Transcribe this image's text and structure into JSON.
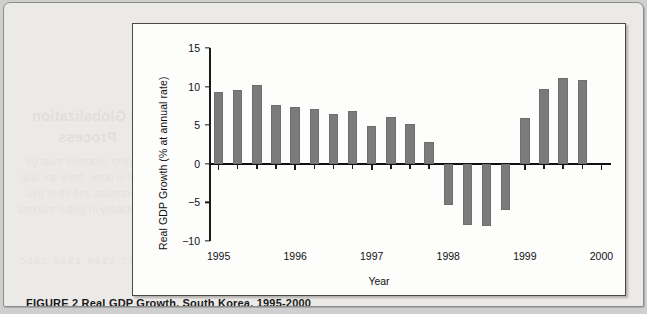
{
  "page": {
    "background_color": "#eceae7",
    "outer_color": "#cfcfcf"
  },
  "figure": {
    "frame_color": "#4a4a4a",
    "plot_background": "#fdfdfc",
    "caption": "FIGURE 2    Real GDP Growth, South Korea, 1995-2000"
  },
  "bleed_text": {
    "heading_1": "Perversions of the Current Globalization",
    "heading_2": "Process",
    "line_1": "nouns that all developing countries must go",
    "line_2": "however the integration is done, there are also",
    "line_3": "that neo-liberal economists and other mis-",
    "line_4": "towards increasing instability in global markets",
    "table_title": "Smaller Economies Bear the Brunt",
    "table_years": "1995    1996    1997    1998    1999    2000"
  },
  "chart_data": {
    "type": "bar",
    "title": "",
    "xlabel": "Year",
    "ylabel": "Real GDP Growth (% at annual rate)",
    "ylim": [
      -10,
      15
    ],
    "yticks": [
      15,
      10,
      5,
      0,
      -5,
      -10
    ],
    "ytick_labels": [
      "15",
      "10",
      "5",
      "0",
      "−5",
      "−10"
    ],
    "grid": false,
    "legend": null,
    "xtick_labels": [
      "1995",
      "1996",
      "1997",
      "1998",
      "1999",
      "2000"
    ],
    "xtick_positions": [
      0,
      4,
      8,
      12,
      16,
      20
    ],
    "x": [
      "1995Q1",
      "1995Q2",
      "1995Q3",
      "1995Q4",
      "1996Q1",
      "1996Q2",
      "1996Q3",
      "1996Q4",
      "1997Q1",
      "1997Q2",
      "1997Q3",
      "1997Q4",
      "1998Q1",
      "1998Q2",
      "1998Q3",
      "1998Q4",
      "1999Q1",
      "1999Q2",
      "1999Q3",
      "1999Q4",
      "2000Q1"
    ],
    "values": [
      9.3,
      9.5,
      10.2,
      7.6,
      7.3,
      7.1,
      6.5,
      6.8,
      4.9,
      6.0,
      5.1,
      2.8,
      -5.4,
      -7.9,
      -8.1,
      -6.0,
      5.9,
      9.7,
      11.1,
      10.9,
      null
    ],
    "bar_color": "#7b7b7b",
    "axis_color": "#111111"
  }
}
